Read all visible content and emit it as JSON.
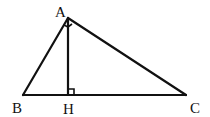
{
  "diagram": {
    "type": "right-triangle-with-altitude",
    "stroke_color": "#111111",
    "points": {
      "A": {
        "label": "A",
        "x": 68,
        "y": 18
      },
      "B": {
        "label": "B",
        "x": 23,
        "y": 95
      },
      "H": {
        "label": "H",
        "x": 68,
        "y": 95
      },
      "C": {
        "label": "C",
        "x": 186,
        "y": 95
      }
    },
    "segments": [
      "AB",
      "AC",
      "BC",
      "AH"
    ],
    "right_angles": [
      "A",
      "H"
    ]
  }
}
